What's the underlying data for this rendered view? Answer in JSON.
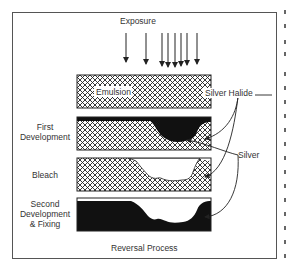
{
  "diagram": {
    "title": "Reversal Process",
    "exposure_label": "Exposure",
    "stages": [
      {
        "label": "Emulsion",
        "kind": "halide"
      },
      {
        "label": "First Development",
        "kind": "first-dev"
      },
      {
        "label": "Bleach",
        "kind": "bleach"
      },
      {
        "label": "Second Development & Fixing",
        "kind": "second-dev"
      }
    ],
    "left_labels": {
      "first_line1": "First",
      "first_line2": "Development",
      "bleach": "Bleach",
      "second_line1": "Second",
      "second_line2": "Development",
      "second_line3": "& Fixing"
    },
    "callouts": {
      "silver_halide": "Silver Halide",
      "silver": "Silver"
    },
    "emulsion_label": "Emulsion",
    "exposure_arrow_x": [
      126,
      146,
      162,
      168,
      175,
      181,
      187,
      197
    ],
    "colors": {
      "line": "#222222",
      "fill": "#111111",
      "frame": "#555555"
    }
  }
}
